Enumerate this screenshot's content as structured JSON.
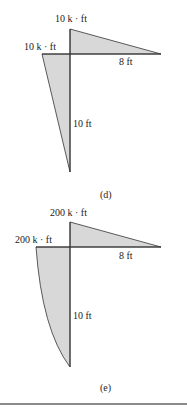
{
  "figures": [
    {
      "id": "d",
      "caption": "(d)",
      "top_moment_label": "10 k · ft",
      "left_moment_label": "10 k · ft",
      "horizontal_length_label": "8 ft",
      "vertical_length_label": "10 ft",
      "shape": "linear"
    },
    {
      "id": "e",
      "caption": "(e)",
      "top_moment_label": "200 k · ft",
      "left_moment_label": "200 k · ft",
      "horizontal_length_label": "8 ft",
      "vertical_length_label": "10 ft",
      "shape": "parabolic"
    }
  ],
  "colors": {
    "fill": "#d8d8d8",
    "line": "#333333",
    "divider": "#8a8a8a"
  }
}
